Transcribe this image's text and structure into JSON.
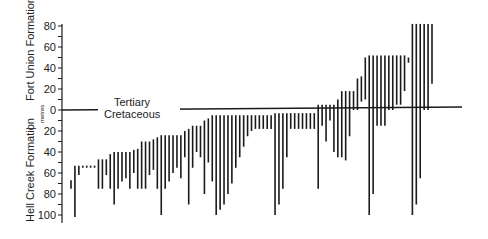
{
  "chart_data": {
    "type": "bar",
    "subtype": "floating-range-bars",
    "title": "",
    "ylabel": "metres",
    "formations": {
      "upper": "Fort Union Formation",
      "lower": "Hell Creek Formation"
    },
    "boundary": {
      "value": 0,
      "above_label": "Tertiary",
      "below_label": "Cretaceous"
    },
    "y_ticks_above": [
      0,
      20,
      40,
      60,
      80
    ],
    "y_ticks_below": [
      20,
      40,
      60,
      80,
      100
    ],
    "ylim": [
      -100,
      80
    ],
    "note": "Each bar spans a stratigraphic range in metres; positive = above K/T boundary (Fort Union), negative = below (Hell Creek).",
    "bars": [
      [
        -67,
        -75
      ],
      [
        -53,
        -102
      ],
      [
        -53,
        -62
      ],
      [
        -53,
        -55
      ],
      [
        -53,
        -55
      ],
      [
        -53,
        -55
      ],
      [
        -53,
        -55
      ],
      [
        -47,
        -75
      ],
      [
        -47,
        -75
      ],
      [
        -47,
        -62
      ],
      [
        -42,
        -75
      ],
      [
        -40,
        -90
      ],
      [
        -40,
        -75
      ],
      [
        -40,
        -68
      ],
      [
        -40,
        -65
      ],
      [
        -40,
        -75
      ],
      [
        -38,
        -60
      ],
      [
        -37,
        -75
      ],
      [
        -30,
        -75
      ],
      [
        -30,
        -75
      ],
      [
        -30,
        -62
      ],
      [
        -28,
        -57
      ],
      [
        -26,
        -75
      ],
      [
        -24,
        -100
      ],
      [
        -24,
        -75
      ],
      [
        -24,
        -68
      ],
      [
        -24,
        -60
      ],
      [
        -24,
        -55
      ],
      [
        -24,
        -65
      ],
      [
        -20,
        -45
      ],
      [
        -18,
        -90
      ],
      [
        -15,
        -55
      ],
      [
        -15,
        -40
      ],
      [
        -15,
        -45
      ],
      [
        -10,
        -80
      ],
      [
        -8,
        -50
      ],
      [
        -5,
        -68
      ],
      [
        -5,
        -100
      ],
      [
        -5,
        -95
      ],
      [
        -5,
        -90
      ],
      [
        -5,
        -80
      ],
      [
        -5,
        -70
      ],
      [
        -5,
        -55
      ],
      [
        -5,
        -45
      ],
      [
        -5,
        -35
      ],
      [
        -5,
        -25
      ],
      [
        -5,
        -20
      ],
      [
        -5,
        -18
      ],
      [
        -5,
        -18
      ],
      [
        -5,
        -18
      ],
      [
        -5,
        -18
      ],
      [
        -5,
        -18
      ],
      [
        -3,
        -100
      ],
      [
        -3,
        -90
      ],
      [
        -3,
        -75
      ],
      [
        -3,
        -45
      ],
      [
        -3,
        -18
      ],
      [
        -3,
        -18
      ],
      [
        -3,
        -18
      ],
      [
        -3,
        -18
      ],
      [
        -3,
        -18
      ],
      [
        -3,
        -18
      ],
      [
        -3,
        -18
      ],
      [
        5,
        -75
      ],
      [
        5,
        -15
      ],
      [
        5,
        -30
      ],
      [
        5,
        -10
      ],
      [
        5,
        -40
      ],
      [
        10,
        -45
      ],
      [
        18,
        -45
      ],
      [
        18,
        -48
      ],
      [
        18,
        -25
      ],
      [
        18,
        0
      ],
      [
        30,
        0
      ],
      [
        32,
        8
      ],
      [
        50,
        10
      ],
      [
        52,
        -100
      ],
      [
        52,
        -80
      ],
      [
        52,
        -15
      ],
      [
        52,
        -15
      ],
      [
        52,
        -15
      ],
      [
        52,
        0
      ],
      [
        52,
        0
      ],
      [
        52,
        5
      ],
      [
        52,
        5
      ],
      [
        52,
        18
      ],
      [
        50,
        45
      ],
      [
        82,
        -100
      ],
      [
        82,
        -90
      ],
      [
        82,
        -65
      ],
      [
        82,
        0
      ],
      [
        82,
        0
      ],
      [
        82,
        25
      ]
    ]
  }
}
